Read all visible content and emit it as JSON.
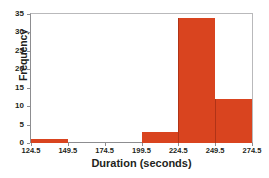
{
  "chart_data": {
    "type": "bar",
    "title": "",
    "xlabel": "Duration (seconds)",
    "ylabel": "Frequency",
    "categories": [
      "124.5-149.5",
      "149.5-174.5",
      "174.5-199.5",
      "199.5-224.5",
      "224.5-249.5",
      "249.5-274.5"
    ],
    "bin_edges": [
      124.5,
      149.5,
      174.5,
      199.5,
      224.5,
      249.5,
      274.5
    ],
    "bin_width": 25,
    "values": [
      1,
      0,
      0,
      3,
      34,
      12
    ],
    "xlim": [
      124.5,
      274.5
    ],
    "ylim": [
      0,
      35
    ],
    "xtick_labels": [
      "124.5",
      "149.5",
      "174.5",
      "199.5",
      "224.5",
      "249.5",
      "274.5"
    ],
    "ytick_labels": [
      "0",
      "5",
      "10",
      "15",
      "20",
      "25",
      "30",
      "35"
    ],
    "ytick_values": [
      0,
      5,
      10,
      15,
      20,
      25,
      30,
      35
    ],
    "grid": false,
    "legend": false,
    "bar_color": "#d9441f",
    "bar_edge_color": "#b03317",
    "axis_color": "#8d8d90",
    "frame_color": "#b9b9bb",
    "text_color": "#231f20"
  }
}
